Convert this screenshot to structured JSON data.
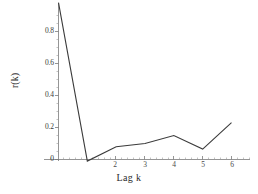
{
  "chart_data": {
    "type": "line",
    "title": "",
    "subtitle": "",
    "xlabel": "Lag k",
    "ylabel": "r(k)",
    "x": [
      0,
      1,
      2,
      3,
      4,
      5,
      6
    ],
    "values": [
      0.98,
      -0.01,
      0.08,
      0.1,
      0.15,
      0.065,
      0.23
    ],
    "series": [
      {
        "name": "r(k)",
        "values": [
          0.98,
          -0.01,
          0.08,
          0.1,
          0.15,
          0.065,
          0.23
        ]
      }
    ],
    "xlim": [
      0,
      6.4
    ],
    "ylim": [
      -0.02,
      1.0
    ],
    "xticks": [
      2,
      3,
      4,
      5,
      6
    ],
    "xtick_labels": [
      "2",
      "3",
      "4",
      "5",
      "6"
    ],
    "yticks": [
      0,
      0.2,
      0.4,
      0.6,
      0.8
    ],
    "ytick_labels": [
      "0",
      "0.2",
      "0.4",
      "0.6",
      "0.8"
    ],
    "grid": false,
    "legend": "none",
    "line_color": "#3b3b3b",
    "axis_color": "#6b6b6b",
    "background_color": "#ffffff"
  },
  "axes": {
    "y_ticks": [
      {
        "label": "0.8",
        "y": 31
      },
      {
        "label": "0.6",
        "y": 63
      },
      {
        "label": "0.4",
        "y": 95
      },
      {
        "label": "0.2",
        "y": 127
      },
      {
        "label": "0",
        "y": 159
      }
    ],
    "x_ticks": [
      {
        "label": "2",
        "x": 115
      },
      {
        "label": "3",
        "x": 145
      },
      {
        "label": "4",
        "x": 174
      },
      {
        "label": "5",
        "x": 203
      },
      {
        "label": "6",
        "x": 232
      }
    ]
  }
}
